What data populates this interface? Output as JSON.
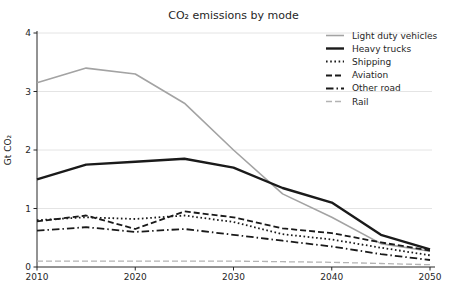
{
  "chart_data": {
    "type": "line",
    "title": "CO₂ emissions by mode",
    "xlabel": "",
    "ylabel": "Gt CO₂",
    "xlim": [
      2010,
      2050
    ],
    "ylim": [
      0,
      4
    ],
    "xticks": [
      2010,
      2020,
      2030,
      2040,
      2050
    ],
    "yticks": [
      0,
      1,
      2,
      3,
      4
    ],
    "grid": "horizontal",
    "legend_position": "upper right",
    "legend_frame": false,
    "x": [
      2010,
      2015,
      2020,
      2025,
      2030,
      2035,
      2040,
      2045,
      2050
    ],
    "series": [
      {
        "name": "Light duty vehicles",
        "color": "#a3a3a3",
        "style": "solid",
        "width": 1.6,
        "values": [
          3.15,
          3.4,
          3.3,
          2.8,
          2.0,
          1.25,
          0.85,
          0.4,
          0.27
        ]
      },
      {
        "name": "Heavy trucks",
        "color": "#1a1a1a",
        "style": "solid",
        "width": 2.4,
        "values": [
          1.5,
          1.75,
          1.8,
          1.85,
          1.7,
          1.35,
          1.1,
          0.55,
          0.3
        ]
      },
      {
        "name": "Shipping",
        "color": "#1a1a1a",
        "style": "dotted",
        "width": 1.8,
        "values": [
          0.8,
          0.85,
          0.82,
          0.88,
          0.77,
          0.56,
          0.47,
          0.33,
          0.2
        ]
      },
      {
        "name": "Aviation",
        "color": "#1a1a1a",
        "style": "dashed",
        "width": 1.8,
        "values": [
          0.78,
          0.88,
          0.65,
          0.95,
          0.85,
          0.66,
          0.58,
          0.42,
          0.28
        ]
      },
      {
        "name": "Other road",
        "color": "#1a1a1a",
        "style": "dashdot",
        "width": 1.8,
        "values": [
          0.62,
          0.68,
          0.6,
          0.65,
          0.55,
          0.45,
          0.35,
          0.22,
          0.12
        ]
      },
      {
        "name": "Rail",
        "color": "#b3b3b3",
        "style": "dashed",
        "width": 1.3,
        "values": [
          0.1,
          0.1,
          0.1,
          0.1,
          0.1,
          0.09,
          0.08,
          0.06,
          0.04
        ]
      }
    ],
    "colors": {
      "axis": "#262626",
      "grid": "#e4e4e4",
      "background": "#ffffff"
    }
  }
}
